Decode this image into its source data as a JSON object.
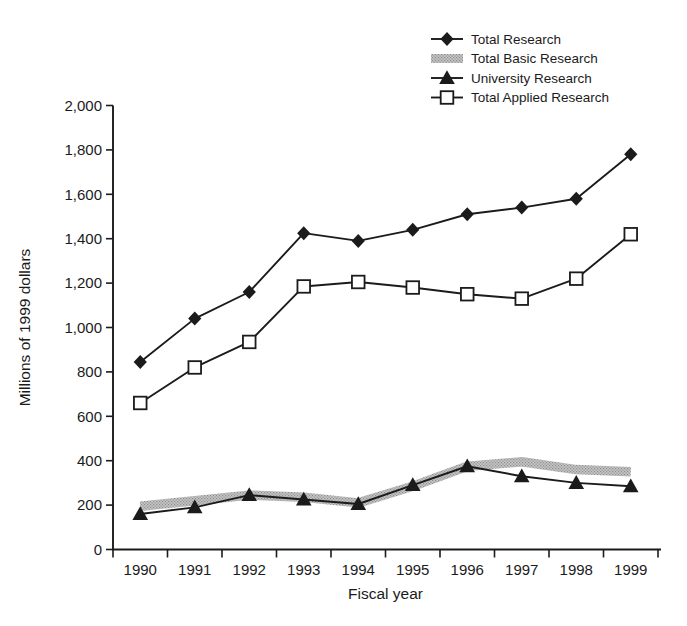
{
  "figure": {
    "background_color": "#ffffff",
    "ink_color": "#1b1b1b",
    "band_fill_color": "#c6c6c6",
    "band_dot_color": "#8d8d8d"
  },
  "chart_data": {
    "type": "line",
    "title": "",
    "xlabel": "Fiscal year",
    "ylabel": "Millions of 1999 dollars",
    "categories": [
      "1990",
      "1991",
      "1992",
      "1993",
      "1994",
      "1995",
      "1996",
      "1997",
      "1998",
      "1999"
    ],
    "ylim": [
      0,
      2000
    ],
    "ytick_interval": 200,
    "ytick_labels": [
      "0",
      "200",
      "400",
      "600",
      "800",
      "1,000",
      "1,200",
      "1,400",
      "1,600",
      "1,800",
      "2,000"
    ],
    "grid": false,
    "legend_position": "top-right",
    "series": [
      {
        "name": "Total Research",
        "style": "line",
        "marker": "filled-diamond",
        "color": "#1b1b1b",
        "values": [
          845,
          1040,
          1160,
          1425,
          1390,
          1440,
          1510,
          1540,
          1580,
          1780
        ]
      },
      {
        "name": "Total Basic Research",
        "style": "band",
        "marker": "none",
        "color": "#b5b5b5",
        "values": [
          195,
          220,
          245,
          235,
          210,
          285,
          375,
          395,
          360,
          350
        ]
      },
      {
        "name": "University Research",
        "style": "line",
        "marker": "filled-triangle",
        "color": "#1b1b1b",
        "values": [
          160,
          190,
          245,
          225,
          205,
          290,
          375,
          330,
          300,
          285
        ]
      },
      {
        "name": "Total Applied Research",
        "style": "line",
        "marker": "open-square",
        "color": "#1b1b1b",
        "values": [
          660,
          820,
          935,
          1185,
          1205,
          1180,
          1150,
          1130,
          1220,
          1420
        ]
      }
    ]
  }
}
